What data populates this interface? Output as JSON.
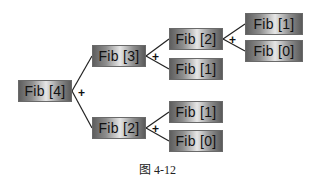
{
  "diagram": {
    "type": "recursion-tree",
    "nodes": {
      "root": {
        "label": "Fib [4]"
      },
      "l1_top": {
        "label": "Fib [3]"
      },
      "l1_bottom": {
        "label": "Fib [2]"
      },
      "l2_top_a": {
        "label": "Fib [2]"
      },
      "l2_top_b": {
        "label": "Fib [1]"
      },
      "l2_bottom_a": {
        "label": "Fib [1]"
      },
      "l2_bottom_b": {
        "label": "Fib [0]"
      },
      "l3_a": {
        "label": "Fib [1]"
      },
      "l3_b": {
        "label": "Fib [0]"
      }
    },
    "edges": [
      [
        "root",
        "l1_top"
      ],
      [
        "root",
        "l1_bottom"
      ],
      [
        "l1_top",
        "l2_top_a"
      ],
      [
        "l1_top",
        "l2_top_b"
      ],
      [
        "l1_bottom",
        "l2_bottom_a"
      ],
      [
        "l1_bottom",
        "l2_bottom_b"
      ],
      [
        "l2_top_a",
        "l3_a"
      ],
      [
        "l2_top_a",
        "l3_b"
      ]
    ],
    "operator": "+",
    "caption": "图 4-12"
  }
}
